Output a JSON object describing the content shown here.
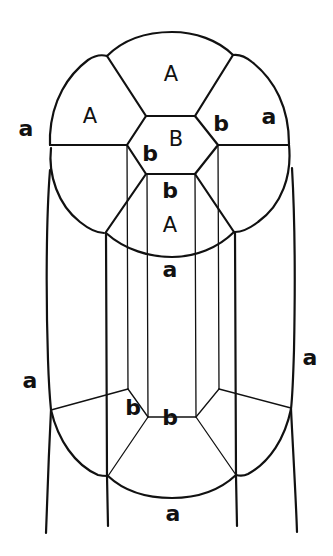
{
  "diagram": {
    "type": "cell-lineage schematic",
    "colors": {
      "stroke": "#111111",
      "background": "#ffffff"
    },
    "labels": [
      {
        "id": "A-top",
        "text": "A",
        "x": 171,
        "y": 74
      },
      {
        "id": "A-left",
        "text": "A",
        "x": 90,
        "y": 116
      },
      {
        "id": "B-center",
        "text": "B",
        "x": 176,
        "y": 139
      },
      {
        "id": "b-right-upper",
        "text": "b",
        "x": 221,
        "y": 123
      },
      {
        "id": "a-right-upper",
        "text": "a",
        "x": 269,
        "y": 116
      },
      {
        "id": "a-left-upper",
        "text": "a",
        "x": 26,
        "y": 128
      },
      {
        "id": "b-center-left",
        "text": "b",
        "x": 150,
        "y": 153
      },
      {
        "id": "b-center-lower",
        "text": "b",
        "x": 170,
        "y": 190
      },
      {
        "id": "A-center-lower",
        "text": "A",
        "x": 170,
        "y": 225
      },
      {
        "id": "a-mid",
        "text": "a",
        "x": 170,
        "y": 269
      },
      {
        "id": "a-left-lower",
        "text": "a",
        "x": 30,
        "y": 380
      },
      {
        "id": "a-right-lower",
        "text": "a",
        "x": 310,
        "y": 357
      },
      {
        "id": "b-bottom-left",
        "text": "b",
        "x": 133,
        "y": 407
      },
      {
        "id": "b-bottom-center",
        "text": "b",
        "x": 170,
        "y": 417
      },
      {
        "id": "a-bottom",
        "text": "a",
        "x": 173,
        "y": 513
      }
    ]
  }
}
